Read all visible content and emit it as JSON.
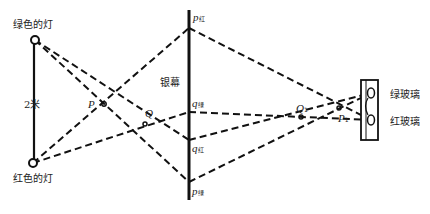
{
  "labels": {
    "green_lamp": "绿色的灯",
    "red_lamp": "红色的灯",
    "distance": "2米",
    "screen": "银幕",
    "green_glass": "绿玻璃",
    "red_glass": "红玻璃",
    "P": "P",
    "Q": "Q",
    "Q1": "Q",
    "Q1_sub": "1",
    "P1": "P",
    "P1_sub": "1",
    "p_red": "p",
    "p_red_sub": "红",
    "q_green": "q",
    "q_green_sub": "绿",
    "q_red": "q",
    "q_red_sub": "红",
    "p_green": "p",
    "p_green_sub": "绿"
  },
  "colors": {
    "ink": "#111111",
    "background": "#ffffff"
  }
}
